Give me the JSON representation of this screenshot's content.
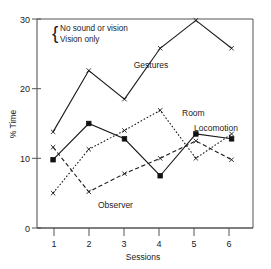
{
  "chart_data": {
    "type": "line",
    "title": "",
    "xlabel": "Sessions",
    "ylabel": "% Time",
    "x": [
      1,
      2,
      3,
      4,
      5,
      6
    ],
    "categories": [
      "1",
      "2",
      "3",
      "4",
      "5",
      "6"
    ],
    "xlim": [
      0.55,
      6.6
    ],
    "ylim": [
      0,
      30
    ],
    "xticks": [
      "1",
      "2",
      "3",
      "4",
      "5",
      "6"
    ],
    "yticks": [
      "0",
      "10",
      "20",
      "30"
    ],
    "ytick_values": [
      0,
      10,
      20,
      30
    ],
    "grid": false,
    "legend_position": "upper-left-inside",
    "origin_label": "0",
    "series": [
      {
        "name": "Gestures",
        "style": "solid",
        "marker": "x",
        "values": [
          13.8,
          22.6,
          18.5,
          25.8,
          29.8,
          25.8
        ]
      },
      {
        "name": "Locomotion",
        "style": "solid",
        "marker": "filled-square",
        "values": [
          9.8,
          15.0,
          12.8,
          7.5,
          13.5,
          12.8
        ]
      },
      {
        "name": "Room",
        "style": "dotted",
        "marker": "x",
        "values": [
          5.0,
          11.3,
          14.0,
          16.9,
          10.0,
          13.5
        ]
      },
      {
        "name": "Observer",
        "style": "dashed",
        "marker": "x",
        "values": [
          11.6,
          5.2,
          7.8,
          10.0,
          12.5,
          9.8
        ]
      }
    ],
    "annotations": [
      {
        "name": "gestures-label",
        "text": "Gestures"
      },
      {
        "name": "room-label",
        "text": "Room"
      },
      {
        "name": "locomotion-label",
        "text": "Locomotion"
      },
      {
        "name": "observer-label",
        "text": "Observer"
      }
    ],
    "legend": {
      "brace": "{",
      "entries": [
        "No sound or vision",
        "Vision only"
      ]
    }
  }
}
